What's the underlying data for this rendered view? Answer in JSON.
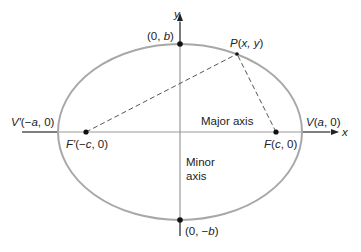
{
  "diagram": {
    "type": "ellipse",
    "colors": {
      "ellipse": "#a8a8a8",
      "axis": "#9a9a9a",
      "text": "#222222",
      "point": "#111111",
      "dashed": "#555555"
    },
    "axes": {
      "x_label": "x",
      "y_label": "y"
    },
    "points": {
      "top_vertex": {
        "label_pre": "(0, ",
        "label_var": "b",
        "label_post": ")"
      },
      "bottom_vertex": {
        "label_pre": "(0, −",
        "label_var": "b",
        "label_post": ")"
      },
      "left_vertex": {
        "name": "V′",
        "label_pre": "(−",
        "label_var": "a",
        "label_post": ", 0)"
      },
      "right_vertex": {
        "name": "V",
        "label_pre": "(",
        "label_var": "a",
        "label_post": ", 0)"
      },
      "left_focus": {
        "name": "F′",
        "label_pre": "(−",
        "label_var": "c",
        "label_post": ", 0)"
      },
      "right_focus": {
        "name": "F",
        "label_pre": "(",
        "label_var": "c",
        "label_post": ", 0)"
      },
      "point_p": {
        "name": "P",
        "label_pre": "(",
        "label_var": "x, y",
        "label_post": ")"
      }
    },
    "annotations": {
      "major_axis": "Major axis",
      "minor_axis_line1": "Minor",
      "minor_axis_line2": "axis"
    }
  }
}
